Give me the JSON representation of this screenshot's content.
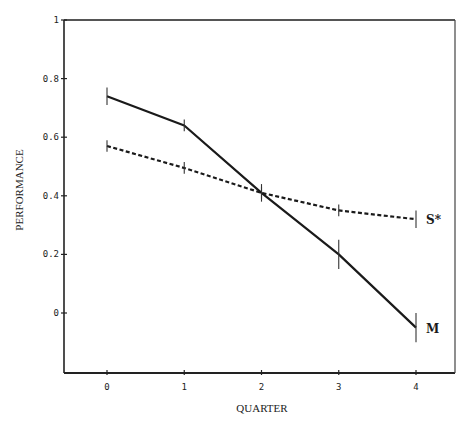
{
  "chart_data": {
    "type": "line",
    "title": "",
    "xlabel": "QUARTER",
    "ylabel": "PERFORMANCE",
    "x": [
      0,
      1,
      2,
      3,
      4
    ],
    "x_tick_labels": [
      "0",
      "1",
      "2",
      "3",
      "4"
    ],
    "y_tick_values": [
      0,
      0.2,
      0.4,
      0.6,
      0.8,
      1
    ],
    "y_tick_labels": [
      "0",
      "0.2",
      "0.4",
      "0.6",
      "0.8",
      "1"
    ],
    "xlim": [
      -0.5,
      4.5
    ],
    "ylim": [
      -0.2,
      1
    ],
    "grid": false,
    "legend_position": "inline-right",
    "series": [
      {
        "name": "M",
        "style": "solid",
        "values": [
          0.74,
          0.64,
          0.41,
          0.2,
          -0.05
        ],
        "error": [
          0.03,
          0.02,
          0.03,
          0.05,
          0.05
        ]
      },
      {
        "name": "S*",
        "style": "dashed",
        "values": [
          0.57,
          0.495,
          0.41,
          0.35,
          0.32
        ],
        "error": [
          0.02,
          0.02,
          0.02,
          0.02,
          0.03
        ]
      }
    ]
  }
}
